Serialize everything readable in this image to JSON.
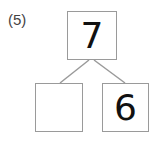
{
  "problem_label": "(5)",
  "number_bond": {
    "whole": "7",
    "parts": [
      "",
      "6"
    ]
  },
  "colors": {
    "box_border": "#9a9a9a",
    "line": "#9a9a9a",
    "text": "#111111"
  }
}
